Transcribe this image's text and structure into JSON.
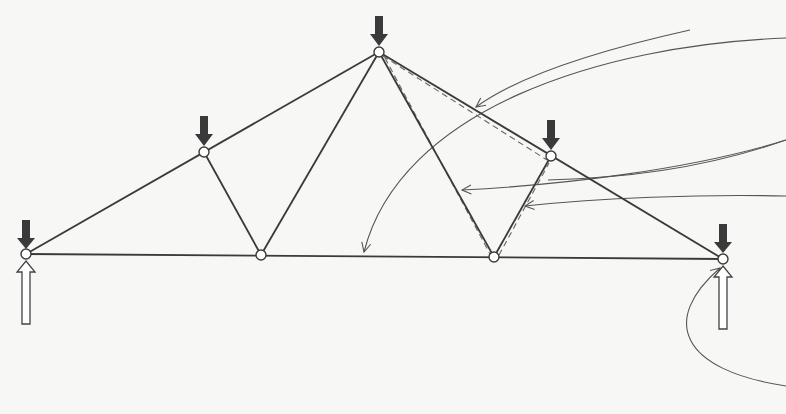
{
  "diagram": {
    "type": "roof truss with loads and reactions",
    "colors": {
      "background": "#f7f7f5",
      "member": "#3a3a3a",
      "dashed_highlight": "#555555",
      "leader": "#555555",
      "load_arrow": "#3a3a3a",
      "reaction_arrow_fill": "#ffffff",
      "reaction_arrow_stroke": "#444444",
      "joint_fill": "#ffffff"
    },
    "joints": [
      {
        "id": "left-support",
        "x": 26,
        "y": 254
      },
      {
        "id": "left-upper",
        "x": 204,
        "y": 152
      },
      {
        "id": "left-bottom",
        "x": 261,
        "y": 255
      },
      {
        "id": "apex",
        "x": 379,
        "y": 52
      },
      {
        "id": "right-bottom",
        "x": 494,
        "y": 257
      },
      {
        "id": "right-upper",
        "x": 551,
        "y": 156
      },
      {
        "id": "right-support",
        "x": 723,
        "y": 259
      }
    ],
    "members": [
      {
        "from": "left-support",
        "to": "apex",
        "name": "top-chord-left"
      },
      {
        "from": "apex",
        "to": "right-support",
        "name": "top-chord-right"
      },
      {
        "from": "left-support",
        "to": "right-support",
        "name": "bottom-chord"
      },
      {
        "from": "left-upper",
        "to": "left-bottom",
        "name": "web-left-1"
      },
      {
        "from": "left-bottom",
        "to": "apex",
        "name": "web-left-2"
      },
      {
        "from": "apex",
        "to": "right-bottom",
        "name": "web-right-1"
      },
      {
        "from": "right-bottom",
        "to": "right-upper",
        "name": "web-right-2"
      }
    ],
    "highlighted_members": [
      "apex-right-upper",
      "apex-right-bottom",
      "right-bottom-right-upper"
    ],
    "loads": [
      {
        "joint": "left-support",
        "direction": "down"
      },
      {
        "joint": "left-upper",
        "direction": "down"
      },
      {
        "joint": "apex",
        "direction": "down"
      },
      {
        "joint": "right-upper",
        "direction": "down"
      },
      {
        "joint": "right-support",
        "direction": "down"
      }
    ],
    "reactions": [
      {
        "joint": "left-support",
        "direction": "up"
      },
      {
        "joint": "right-support",
        "direction": "up"
      }
    ],
    "leaders": [
      {
        "name": "leader-bottom-chord",
        "target": "bottom chord"
      },
      {
        "name": "leader-web-right-1",
        "target": "web apex to right-bottom"
      },
      {
        "name": "leader-web-right-2",
        "target": "web right-bottom to right-upper"
      },
      {
        "name": "leader-top-chord-right",
        "target": "top chord right"
      },
      {
        "name": "leader-right-support",
        "target": "right support joint"
      }
    ]
  }
}
